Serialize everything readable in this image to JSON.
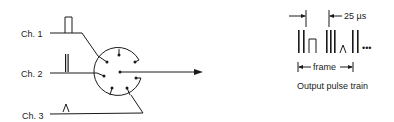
{
  "diagram": {
    "type": "time-division multiplexing commutator",
    "inputs": [
      {
        "label": "Ch. 1",
        "waveform": "rectangular-pulse"
      },
      {
        "label": "Ch. 2",
        "waveform": "narrow-double-pulse"
      },
      {
        "label": "Ch. 3",
        "waveform": "triangular-pulse"
      }
    ],
    "commutator": {
      "contacts": 7,
      "has_center_rotor": true
    },
    "output": {
      "caption": "Output pulse train",
      "slot_label": "25 µs",
      "frame_label": "frame",
      "continuation": "•••"
    }
  },
  "colors": {
    "ink": "#1a1a1a",
    "background": "#ffffff"
  }
}
